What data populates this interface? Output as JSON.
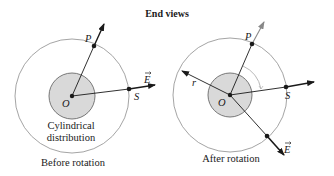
{
  "title": "End views",
  "colors": {
    "ink": "#1a1a1a",
    "circle_stroke": "#9a9a9a",
    "shaded_fill": "#d9d9d9",
    "arc": "#b0b0b0",
    "background": "#ffffff"
  },
  "panels": [
    {
      "id": "before",
      "caption": "Before rotation",
      "distribution_label_line1": "Cylindrical",
      "distribution_label_line2": "distribution",
      "labels": {
        "origin": "O",
        "point_p": "P",
        "point_s": "S",
        "field": "E"
      },
      "geometry": {
        "center": [
          72,
          96
        ],
        "outer_radius": 57,
        "inner_radius": 23,
        "p_point": [
          94,
          46
        ],
        "p_arrow_tip": [
          104,
          24
        ],
        "s_point": [
          129,
          89
        ],
        "s_arrow_tip": [
          155,
          85
        ]
      }
    },
    {
      "id": "after",
      "caption": "After rotation",
      "labels": {
        "origin": "O",
        "point_p": "P",
        "point_s": "S",
        "field": "E",
        "radius": "r"
      },
      "geometry": {
        "center": [
          230,
          95
        ],
        "outer_radius": 57,
        "inner_radius": 22,
        "p_point": [
          252,
          44
        ],
        "p_arrow_tip": [
          264,
          22
        ],
        "s_point": [
          286,
          87
        ],
        "s_arrow_tip": [
          314,
          82
        ],
        "r_arrow_tip": [
          182,
          71
        ],
        "e_point": [
          267,
          136
        ],
        "e_arrow_tip": [
          284,
          155
        ]
      }
    }
  ]
}
